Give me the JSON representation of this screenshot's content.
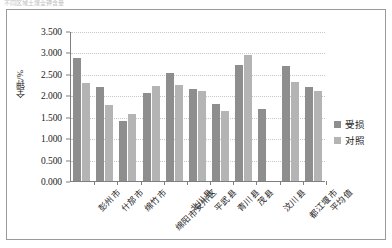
{
  "caption": {
    "text": "不同区域土壤全钾含量"
  },
  "legend": {
    "position": "right",
    "items": [
      {
        "label": "受损",
        "color": "#8e8e8e"
      },
      {
        "label": "对照",
        "color": "#b4b4b4"
      }
    ]
  },
  "axes": {
    "y_title": "全钾/%",
    "y_ticks": [
      "0.000",
      "0.500",
      "1.000",
      "1.500",
      "2.000",
      "2.500",
      "3.000",
      "3.500"
    ]
  },
  "chart_data": {
    "type": "bar",
    "title": "",
    "xlabel": "",
    "ylabel": "全钾/%",
    "ylim": [
      0,
      3.5
    ],
    "ytick_step": 0.5,
    "grid": true,
    "legend_position": "right",
    "categories": [
      "彭州市",
      "什邡市",
      "绵竹市",
      "绵阳市安州区",
      "北川县",
      "平武县",
      "青川县",
      "茂县",
      "汶川县",
      "都江堰市",
      "平均值"
    ],
    "series": [
      {
        "name": "受损",
        "color": "#8e8e8e",
        "values": [
          2.87,
          2.2,
          1.41,
          2.05,
          2.52,
          2.15,
          1.79,
          2.7,
          1.69,
          2.68,
          2.2
        ]
      },
      {
        "name": "对照",
        "color": "#b4b4b4",
        "values": [
          2.28,
          1.78,
          1.57,
          2.22,
          2.25,
          2.09,
          1.63,
          2.93,
          null,
          2.31,
          2.09
        ]
      }
    ]
  }
}
